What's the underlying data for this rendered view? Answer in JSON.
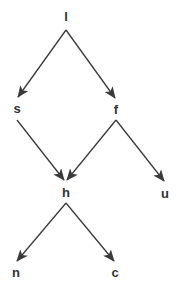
{
  "diagram": {
    "type": "directed-graph",
    "colors": {
      "edge": "#3a3a3a",
      "label": "#333333",
      "background": "#ffffff"
    },
    "nodes": [
      {
        "id": "l",
        "label": "l",
        "x": 66,
        "y": 16
      },
      {
        "id": "s",
        "label": "s",
        "x": 17,
        "y": 108
      },
      {
        "id": "f",
        "label": "f",
        "x": 116,
        "y": 109
      },
      {
        "id": "h",
        "label": "h",
        "x": 66,
        "y": 192
      },
      {
        "id": "u",
        "label": "u",
        "x": 165,
        "y": 193
      },
      {
        "id": "n",
        "label": "n",
        "x": 16,
        "y": 272
      },
      {
        "id": "c",
        "label": "c",
        "x": 115,
        "y": 272
      }
    ],
    "edges": [
      {
        "from": "l",
        "to": "s"
      },
      {
        "from": "l",
        "to": "f"
      },
      {
        "from": "s",
        "to": "h"
      },
      {
        "from": "f",
        "to": "h"
      },
      {
        "from": "f",
        "to": "u"
      },
      {
        "from": "h",
        "to": "n"
      },
      {
        "from": "h",
        "to": "c"
      }
    ]
  }
}
